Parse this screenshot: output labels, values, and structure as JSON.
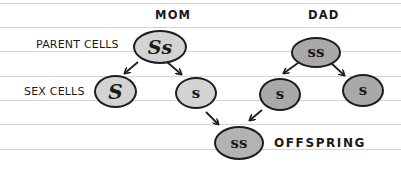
{
  "diagram": {
    "type": "inheritance-genetics",
    "labels": {
      "mom": "MOM",
      "dad": "DAD",
      "parent_cells": "PARENT CELLS",
      "sex_cells": "SEX CELLS",
      "offspring": "OFFSPRING"
    },
    "cells": {
      "mom_parent": {
        "genotype": "Ss",
        "fill": "#d3d3d3"
      },
      "mom_sex_1": {
        "genotype": "S",
        "fill": "#d3d3d3"
      },
      "mom_sex_2": {
        "genotype": "s",
        "fill": "#d3d3d3"
      },
      "dad_parent": {
        "genotype": "ss",
        "fill": "#a9a9a9"
      },
      "dad_sex_1": {
        "genotype": "s",
        "fill": "#a9a9a9"
      },
      "dad_sex_2": {
        "genotype": "s",
        "fill": "#a9a9a9"
      },
      "offspring": {
        "genotype": "ss",
        "fill": "#b3b3b3"
      }
    },
    "colors": {
      "mom_cell": "#d3d3d3",
      "dad_cell": "#a9a9a9",
      "offspring_cell": "#b3b3b3",
      "outline": "#1e1e1e",
      "ruled_line": "#d4d4d4"
    },
    "edges": [
      {
        "from": "mom_parent",
        "to": "mom_sex_1"
      },
      {
        "from": "mom_parent",
        "to": "mom_sex_2"
      },
      {
        "from": "dad_parent",
        "to": "dad_sex_1"
      },
      {
        "from": "dad_parent",
        "to": "dad_sex_2"
      },
      {
        "from": "mom_sex_2",
        "to": "offspring"
      },
      {
        "from": "dad_sex_1",
        "to": "offspring"
      }
    ]
  }
}
